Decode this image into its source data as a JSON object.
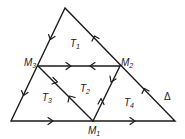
{
  "diagram": {
    "type": "triangle-subdivision",
    "points": {
      "apex": [
        65,
        8
      ],
      "bottom_left": [
        11,
        121
      ],
      "bottom_right": [
        175,
        121
      ],
      "M1": [
        93,
        121
      ],
      "M2": [
        120,
        66
      ],
      "M3": [
        38,
        66
      ]
    },
    "labels": {
      "M1": {
        "main": "M",
        "sub": "1"
      },
      "M2": {
        "main": "M",
        "sub": "2"
      },
      "M3": {
        "main": "M",
        "sub": "3"
      },
      "T1": {
        "main": "T",
        "sub": "1"
      },
      "T2": {
        "main": "T",
        "sub": "2"
      },
      "T3": {
        "main": "T",
        "sub": "3"
      },
      "T4": {
        "main": "T",
        "sub": "4"
      },
      "delta": "Δ"
    },
    "edges": [
      {
        "from": "apex",
        "to": "M3",
        "arrow": "toward M3"
      },
      {
        "from": "M3",
        "to": "bottom_left",
        "arrow": "toward bottom_left"
      },
      {
        "from": "bottom_left",
        "to": "M1",
        "arrow": "toward M1"
      },
      {
        "from": "M1",
        "to": "bottom_right",
        "arrow": "toward bottom_right"
      },
      {
        "from": "bottom_right",
        "to": "M2",
        "arrow": "toward M2"
      },
      {
        "from": "M2",
        "to": "apex",
        "arrow": "toward apex"
      },
      {
        "from": "M3",
        "to": "M2",
        "arrow": "both (two opposing arrows)"
      },
      {
        "from": "M3",
        "to": "M1",
        "arrow": "both (two opposing arrows)"
      },
      {
        "from": "M2",
        "to": "M1",
        "arrow": "both (two opposing arrows)"
      }
    ]
  }
}
